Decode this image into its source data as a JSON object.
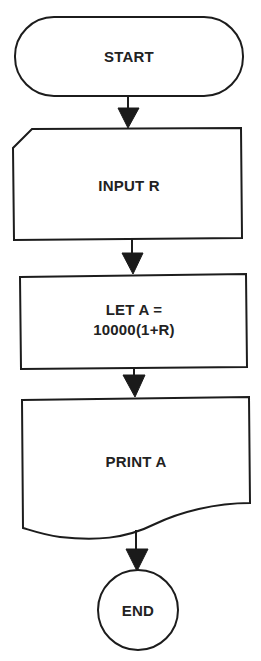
{
  "diagram": {
    "type": "flowchart",
    "direction": "top-to-bottom",
    "stroke_color": "#1c1c1c",
    "text_color": "#222222",
    "background": "#ffffff",
    "nodes": [
      {
        "id": "start",
        "shape": "terminal",
        "label": "START"
      },
      {
        "id": "input",
        "shape": "input-card",
        "label": "INPUT R"
      },
      {
        "id": "process",
        "shape": "process",
        "label_line1": "LET A =",
        "label_line2": "10000(1+R)"
      },
      {
        "id": "print",
        "shape": "document",
        "label": "PRINT A"
      },
      {
        "id": "end",
        "shape": "connector-circle",
        "label": "END"
      }
    ],
    "edges": [
      {
        "from": "start",
        "to": "input"
      },
      {
        "from": "input",
        "to": "process"
      },
      {
        "from": "process",
        "to": "print"
      },
      {
        "from": "print",
        "to": "end"
      }
    ]
  }
}
